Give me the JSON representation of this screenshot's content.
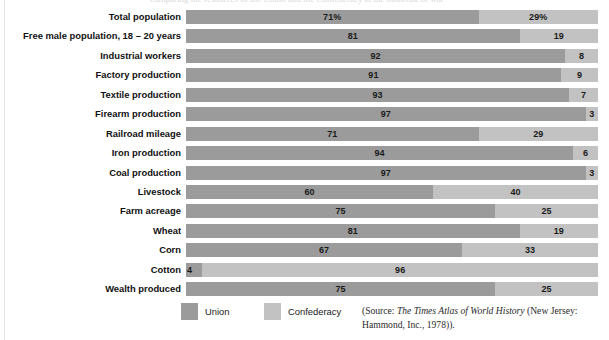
{
  "figure": {
    "cropped_caption": "comparing the resources of the Union and the Confederacy at the outbreak of war",
    "source_note_prefix": "(Source:",
    "source_title": "The Times Atlas of World History",
    "source_suffix": "(New Jersey: Hammond, Inc., 1978))."
  },
  "legend": {
    "union": {
      "label": "Union",
      "color": "#9b9b9b"
    },
    "confederacy": {
      "label": "Confederacy",
      "color": "#c2c2c2"
    }
  },
  "chart_data": {
    "type": "bar",
    "orientation": "horizontal",
    "stacked": true,
    "normalized_total": 100,
    "title": "",
    "subtitle": "",
    "xlabel": "",
    "ylabel": "",
    "xlim": [
      0,
      100
    ],
    "grid": false,
    "legend_position": "bottom-left",
    "categories": [
      "Total population",
      "Free male population, 18 – 20 years",
      "Industrial workers",
      "Factory production",
      "Textile production",
      "Firearm production",
      "Railroad mileage",
      "Iron production",
      "Coal production",
      "Livestock",
      "Farm acreage",
      "Wheat",
      "Corn",
      "Cotton",
      "Wealth produced"
    ],
    "series": [
      {
        "name": "Union",
        "color": "#9b9b9b",
        "values": [
          71,
          81,
          92,
          91,
          93,
          97,
          71,
          94,
          97,
          60,
          75,
          81,
          67,
          4,
          75
        ]
      },
      {
        "name": "Confederacy",
        "color": "#c2c2c2",
        "values": [
          29,
          19,
          8,
          9,
          7,
          3,
          29,
          6,
          3,
          40,
          25,
          19,
          33,
          96,
          25
        ]
      }
    ],
    "data_labels": [
      {
        "category": "Total population",
        "union": "71%",
        "confederacy": "29%"
      },
      {
        "category": "Free male population, 18 – 20 years",
        "union": "81",
        "confederacy": "19"
      },
      {
        "category": "Industrial workers",
        "union": "92",
        "confederacy": "8"
      },
      {
        "category": "Factory production",
        "union": "91",
        "confederacy": "9"
      },
      {
        "category": "Textile production",
        "union": "93",
        "confederacy": "7"
      },
      {
        "category": "Firearm production",
        "union": "97",
        "confederacy": "3"
      },
      {
        "category": "Railroad mileage",
        "union": "71",
        "confederacy": "29"
      },
      {
        "category": "Iron production",
        "union": "94",
        "confederacy": "6"
      },
      {
        "category": "Coal production",
        "union": "97",
        "confederacy": "3"
      },
      {
        "category": "Livestock",
        "union": "60",
        "confederacy": "40"
      },
      {
        "category": "Farm acreage",
        "union": "75",
        "confederacy": "25"
      },
      {
        "category": "Wheat",
        "union": "81",
        "confederacy": "19"
      },
      {
        "category": "Corn",
        "union": "67",
        "confederacy": "33"
      },
      {
        "category": "Cotton",
        "union": "4",
        "confederacy": "96"
      },
      {
        "category": "Wealth produced",
        "union": "75",
        "confederacy": "25"
      }
    ]
  }
}
